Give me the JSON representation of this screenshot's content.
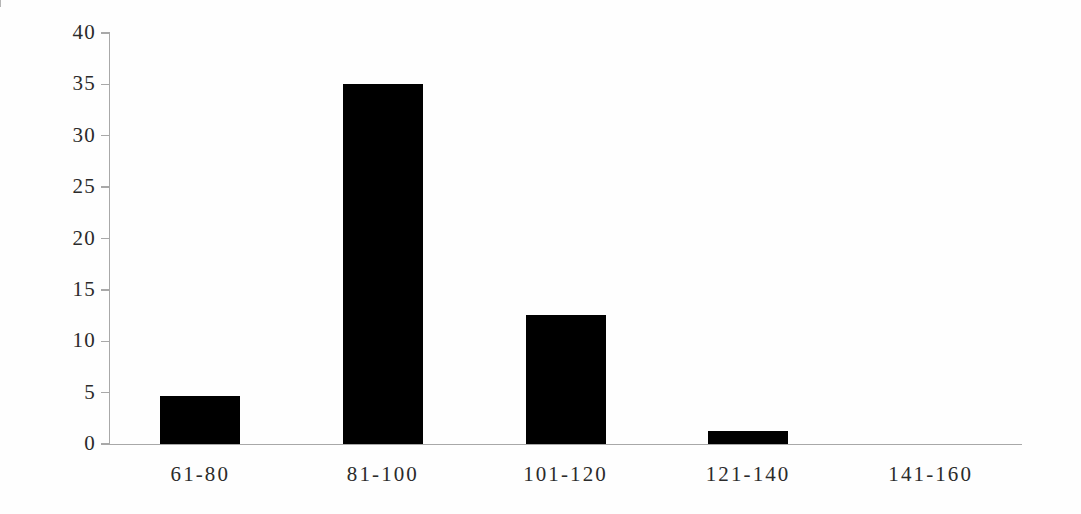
{
  "chart_data": {
    "type": "bar",
    "title": "",
    "subtitle": "",
    "xlabel": "",
    "ylabel": "",
    "categories": [
      "61-80",
      "81-100",
      "101-120",
      "121-140",
      "141-160"
    ],
    "values": [
      4.7,
      35.0,
      12.6,
      1.3,
      0.0
    ],
    "series": [
      {
        "name": "",
        "values": [
          4.7,
          35.0,
          12.6,
          1.3,
          0.0
        ]
      }
    ],
    "ylim": [
      0,
      40
    ],
    "ytick_labels": [
      "0",
      "5",
      "10",
      "15",
      "20",
      "25",
      "30",
      "35",
      "40"
    ],
    "ytick_values": [
      0,
      5,
      10,
      15,
      20,
      25,
      30,
      35,
      40
    ],
    "xtick_labels": [
      "61-80",
      "81-100",
      "101-120",
      "121-140",
      "141-160"
    ],
    "grid": false,
    "legend": false,
    "legend_position": "none",
    "bar_color": "#000000",
    "axis_color": "#a8a8a8",
    "text_color": "#2b2b2b",
    "background_color": "#ffffff",
    "annotations": []
  }
}
